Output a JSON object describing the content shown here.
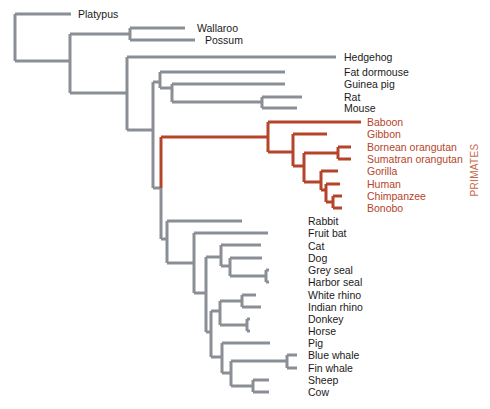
{
  "diagram": {
    "type": "phylogenetic-tree",
    "colors": {
      "default_branch": "#8a8f96",
      "primate_branch": "#b5452a",
      "default_label": "#1a1a1a",
      "primate_label": "#b5452a",
      "background": "#ffffff"
    },
    "group_label": {
      "text": "PRIMATES",
      "x": 478,
      "y": 170,
      "color": "#c86a4a"
    },
    "leaves": [
      {
        "name": "Platypus",
        "y": 14,
        "tip_x": 71,
        "label_x": 78,
        "group": "default"
      },
      {
        "name": "Wallaroo",
        "y": 28,
        "tip_x": 185,
        "label_x": 197,
        "group": "default"
      },
      {
        "name": "Possum",
        "y": 40,
        "tip_x": 195,
        "label_x": 205,
        "group": "default"
      },
      {
        "name": "Hedgehog",
        "y": 57,
        "tip_x": 336,
        "label_x": 344,
        "group": "default"
      },
      {
        "name": "Fat dormouse",
        "y": 72,
        "tip_x": 285,
        "label_x": 344,
        "group": "default"
      },
      {
        "name": "Guinea pig",
        "y": 84,
        "tip_x": 285,
        "label_x": 344,
        "group": "default"
      },
      {
        "name": "Rat",
        "y": 97,
        "tip_x": 302,
        "label_x": 344,
        "group": "default"
      },
      {
        "name": "Mouse",
        "y": 108,
        "tip_x": 297,
        "label_x": 344,
        "group": "default"
      },
      {
        "name": "Baboon",
        "y": 122,
        "tip_x": 361,
        "label_x": 367,
        "group": "primates"
      },
      {
        "name": "Gibbon",
        "y": 134,
        "tip_x": 327,
        "label_x": 367,
        "group": "primates"
      },
      {
        "name": "Bornean orangutan",
        "y": 147,
        "tip_x": 351,
        "label_x": 367,
        "group": "primates"
      },
      {
        "name": "Sumatran orangutan",
        "y": 159,
        "tip_x": 351,
        "label_x": 367,
        "group": "primates"
      },
      {
        "name": "Gorilla",
        "y": 171,
        "tip_x": 338,
        "label_x": 367,
        "group": "primates"
      },
      {
        "name": "Human",
        "y": 184,
        "tip_x": 340,
        "label_x": 367,
        "group": "primates"
      },
      {
        "name": "Chimpanzee",
        "y": 196,
        "tip_x": 342,
        "label_x": 367,
        "group": "primates"
      },
      {
        "name": "Bonobo",
        "y": 208,
        "tip_x": 342,
        "label_x": 367,
        "group": "primates"
      },
      {
        "name": "Rabbit",
        "y": 221,
        "tip_x": 242,
        "label_x": 308,
        "group": "default"
      },
      {
        "name": "Fruit bat",
        "y": 233,
        "tip_x": 268,
        "label_x": 308,
        "group": "default"
      },
      {
        "name": "Cat",
        "y": 246,
        "tip_x": 261,
        "label_x": 308,
        "group": "default"
      },
      {
        "name": "Dog",
        "y": 258,
        "tip_x": 262,
        "label_x": 308,
        "group": "default"
      },
      {
        "name": "Grey seal",
        "y": 270,
        "tip_x": 269,
        "label_x": 308,
        "group": "default"
      },
      {
        "name": "Harbor seal",
        "y": 282,
        "tip_x": 269,
        "label_x": 308,
        "group": "default"
      },
      {
        "name": "White rhino",
        "y": 295,
        "tip_x": 256,
        "label_x": 308,
        "group": "default"
      },
      {
        "name": "Indian rhino",
        "y": 307,
        "tip_x": 261,
        "label_x": 308,
        "group": "default"
      },
      {
        "name": "Donkey",
        "y": 319,
        "tip_x": 250,
        "label_x": 308,
        "group": "default"
      },
      {
        "name": "Horse",
        "y": 331,
        "tip_x": 250,
        "label_x": 308,
        "group": "default"
      },
      {
        "name": "Pig",
        "y": 343,
        "tip_x": 270,
        "label_x": 308,
        "group": "default"
      },
      {
        "name": "Blue whale",
        "y": 355,
        "tip_x": 297,
        "label_x": 308,
        "group": "default"
      },
      {
        "name": "Fin whale",
        "y": 368,
        "tip_x": 297,
        "label_x": 308,
        "group": "default"
      },
      {
        "name": "Sheep",
        "y": 380,
        "tip_x": 269,
        "label_x": 308,
        "group": "default"
      },
      {
        "name": "Cow",
        "y": 392,
        "tip_x": 269,
        "label_x": 308,
        "group": "default"
      }
    ],
    "branches": [
      {
        "d": "M15,14 L15,61",
        "group": "default"
      },
      {
        "d": "M15,14 L71,14",
        "group": "default"
      },
      {
        "d": "M15,61 L70,61",
        "group": "default"
      },
      {
        "d": "M70,34 L70,93",
        "group": "default"
      },
      {
        "d": "M70,34 L130,34",
        "group": "default"
      },
      {
        "d": "M130,28 L130,40",
        "group": "default"
      },
      {
        "d": "M130,28 L185,28",
        "group": "default"
      },
      {
        "d": "M130,40 L195,40",
        "group": "default"
      },
      {
        "d": "M70,93 L127,93",
        "group": "default"
      },
      {
        "d": "M127,57 L127,130",
        "group": "default"
      },
      {
        "d": "M127,57 L336,57",
        "group": "default"
      },
      {
        "d": "M127,130 L153,130",
        "group": "default"
      },
      {
        "d": "M153,82 L153,188",
        "group": "default"
      },
      {
        "d": "M153,82 L160,82",
        "group": "default"
      },
      {
        "d": "M160,72 L160,88",
        "group": "default"
      },
      {
        "d": "M160,72 L285,72",
        "group": "default"
      },
      {
        "d": "M160,88 L172,88",
        "group": "default"
      },
      {
        "d": "M172,84 L172,102",
        "group": "default"
      },
      {
        "d": "M172,84 L285,84",
        "group": "default"
      },
      {
        "d": "M172,102 L262,102",
        "group": "default"
      },
      {
        "d": "M262,97 L262,108",
        "group": "default"
      },
      {
        "d": "M262,97 L302,97",
        "group": "default"
      },
      {
        "d": "M262,108 L297,108",
        "group": "default"
      },
      {
        "d": "M153,188 L161,188",
        "group": "default"
      },
      {
        "d": "M161,137 L161,188",
        "group": "primates"
      },
      {
        "d": "M161,188 L161,239",
        "group": "default"
      },
      {
        "d": "M161,137 L268,137",
        "group": "primates"
      },
      {
        "d": "M268,122 L268,152",
        "group": "primates"
      },
      {
        "d": "M268,122 L361,122",
        "group": "primates"
      },
      {
        "d": "M268,152 L293,152",
        "group": "primates"
      },
      {
        "d": "M293,134 L293,166",
        "group": "primates"
      },
      {
        "d": "M293,134 L327,134",
        "group": "primates"
      },
      {
        "d": "M293,166 L304,166",
        "group": "primates"
      },
      {
        "d": "M304,153 L304,182",
        "group": "primates"
      },
      {
        "d": "M304,153 L338,153",
        "group": "primates"
      },
      {
        "d": "M338,147 L338,159",
        "group": "primates"
      },
      {
        "d": "M338,147 L351,147",
        "group": "primates"
      },
      {
        "d": "M338,159 L351,159",
        "group": "primates"
      },
      {
        "d": "M304,182 L321,182",
        "group": "primates"
      },
      {
        "d": "M321,171 L321,190",
        "group": "primates"
      },
      {
        "d": "M321,171 L338,171",
        "group": "primates"
      },
      {
        "d": "M321,190 L326,190",
        "group": "primates"
      },
      {
        "d": "M326,184 L326,202",
        "group": "primates"
      },
      {
        "d": "M326,184 L340,184",
        "group": "primates"
      },
      {
        "d": "M326,202 L333,202",
        "group": "primates"
      },
      {
        "d": "M333,196 L333,208",
        "group": "primates"
      },
      {
        "d": "M333,196 L342,196",
        "group": "primates"
      },
      {
        "d": "M333,208 L342,208",
        "group": "primates"
      },
      {
        "d": "M161,239 L167,239",
        "group": "default"
      },
      {
        "d": "M167,221 L167,263",
        "group": "default"
      },
      {
        "d": "M167,221 L242,221",
        "group": "default"
      },
      {
        "d": "M167,263 L194,263",
        "group": "default"
      },
      {
        "d": "M194,233 L194,293",
        "group": "default"
      },
      {
        "d": "M194,233 L268,233",
        "group": "default"
      },
      {
        "d": "M194,293 L206,293",
        "group": "default"
      },
      {
        "d": "M206,257 L206,332",
        "group": "default"
      },
      {
        "d": "M206,257 L221,257",
        "group": "default"
      },
      {
        "d": "M221,245 L221,266",
        "group": "default"
      },
      {
        "d": "M221,245 L261,245",
        "group": "default"
      },
      {
        "d": "M221,266 L230,266",
        "group": "default"
      },
      {
        "d": "M230,258 L230,276",
        "group": "default"
      },
      {
        "d": "M230,258 L262,258",
        "group": "default"
      },
      {
        "d": "M230,276 L266,276",
        "group": "default"
      },
      {
        "d": "M266,270 L266,282",
        "group": "default"
      },
      {
        "d": "M266,270 L269,270",
        "group": "default"
      },
      {
        "d": "M266,282 L269,282",
        "group": "default"
      },
      {
        "d": "M206,332 L211,332",
        "group": "default"
      },
      {
        "d": "M211,311 L211,357",
        "group": "default"
      },
      {
        "d": "M211,311 L220,311",
        "group": "default"
      },
      {
        "d": "M220,301 L220,325",
        "group": "default"
      },
      {
        "d": "M220,301 L242,301",
        "group": "default"
      },
      {
        "d": "M242,295 L242,307",
        "group": "default"
      },
      {
        "d": "M242,295 L256,295",
        "group": "default"
      },
      {
        "d": "M242,307 L261,307",
        "group": "default"
      },
      {
        "d": "M220,325 L247,325",
        "group": "default"
      },
      {
        "d": "M247,319 L247,331",
        "group": "default"
      },
      {
        "d": "M247,319 L250,319",
        "group": "default"
      },
      {
        "d": "M247,331 L250,331",
        "group": "default"
      },
      {
        "d": "M211,357 L222,357",
        "group": "default"
      },
      {
        "d": "M222,343 L222,373",
        "group": "default"
      },
      {
        "d": "M222,343 L270,343",
        "group": "default"
      },
      {
        "d": "M222,373 L231,373",
        "group": "default"
      },
      {
        "d": "M231,361 L231,386",
        "group": "default"
      },
      {
        "d": "M231,361 L287,361",
        "group": "default"
      },
      {
        "d": "M287,355 L287,368",
        "group": "default"
      },
      {
        "d": "M287,355 L297,355",
        "group": "default"
      },
      {
        "d": "M287,368 L297,368",
        "group": "default"
      },
      {
        "d": "M231,386 L253,386",
        "group": "default"
      },
      {
        "d": "M253,380 L253,392",
        "group": "default"
      },
      {
        "d": "M253,380 L269,380",
        "group": "default"
      },
      {
        "d": "M253,392 L269,392",
        "group": "default"
      }
    ]
  }
}
